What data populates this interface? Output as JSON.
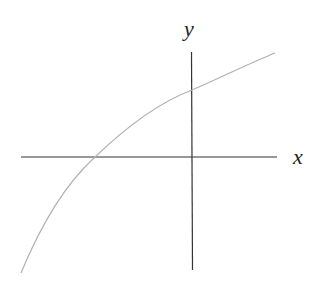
{
  "diagram": {
    "type": "function-graph",
    "axes": {
      "x_label": "x",
      "y_label": "y"
    },
    "curve": {
      "shape": "increasing concave",
      "x_intercept": "negative x",
      "y_intercept": "positive y"
    },
    "colors": {
      "axes": "#333333",
      "curve": "#b0b0b0"
    }
  }
}
